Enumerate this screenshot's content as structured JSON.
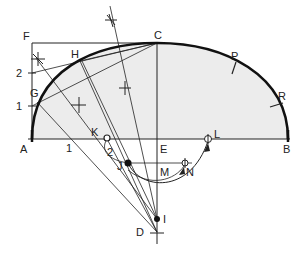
{
  "diagram": {
    "type": "geometric-construction",
    "colors": {
      "line": "#222222",
      "fill": "#ececec",
      "background": "#ffffff"
    },
    "labels": {
      "A": "A",
      "B": "B",
      "C": "C",
      "D": "D",
      "E": "E",
      "F": "F",
      "G": "G",
      "H": "H",
      "I": "I",
      "J": "J",
      "K": "K",
      "L": "L",
      "M": "M",
      "N": "N",
      "P": "P",
      "R": "R",
      "div_1_vertical": "1",
      "div_2_vertical": "2",
      "div_1_horizontal": "1",
      "div_2_arc": "2"
    }
  }
}
